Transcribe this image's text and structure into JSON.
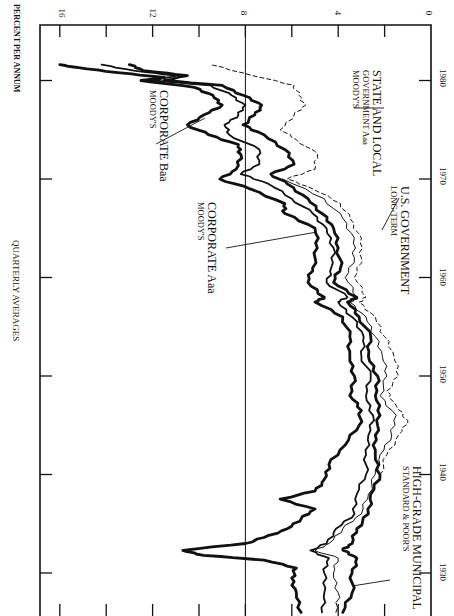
{
  "chart_data": {
    "type": "line",
    "orientation": "rotated-90",
    "title": "QUARTERLY AVERAGES",
    "xlabel": "",
    "ylabel": "PERCENT PER ANNUM",
    "xlim": [
      1926,
      1982
    ],
    "ylim": [
      0,
      17
    ],
    "x_ticks": [
      1930,
      1940,
      1950,
      1960,
      1970,
      1980
    ],
    "y_ticks": [
      0,
      2,
      4,
      6,
      8,
      10,
      12,
      14,
      16
    ],
    "y_tick_labels": [
      "0",
      "4",
      "8",
      "12",
      "16"
    ],
    "reference_line": 8,
    "grid": false,
    "series": [
      {
        "name": "CORPORATE Baa",
        "source": "MOODY'S",
        "style": "thick",
        "x": [
          1926,
          1928,
          1929.5,
          1930.5,
          1931.3,
          1931.8,
          1932.3,
          1933,
          1933.6,
          1934.5,
          1935.5,
          1936.5,
          1937.5,
          1938.3,
          1939.5,
          1941,
          1943,
          1945,
          1946.5,
          1948,
          1950,
          1952,
          1954,
          1956,
          1957.5,
          1958,
          1959.5,
          1961,
          1963,
          1965,
          1966.5,
          1967.5,
          1969,
          1970,
          1971,
          1972.5,
          1973.5,
          1974.5,
          1975.5,
          1976.5,
          1977.5,
          1978.5,
          1979.3,
          1980,
          1980.3,
          1980.8,
          1981.3,
          1981.6
        ],
        "values": [
          5.6,
          5.8,
          6.0,
          5.8,
          7.2,
          9.8,
          10.7,
          8.0,
          7.2,
          6.2,
          5.6,
          5.0,
          6.5,
          5.0,
          4.6,
          4.4,
          3.7,
          3.1,
          3.0,
          3.5,
          3.3,
          3.5,
          3.5,
          3.8,
          5.0,
          4.6,
          5.3,
          5.1,
          4.9,
          5.0,
          6.3,
          6.3,
          7.8,
          9.1,
          8.4,
          8.2,
          8.3,
          9.6,
          10.5,
          9.8,
          9.0,
          9.4,
          10.2,
          12.5,
          11.5,
          13.5,
          15.2,
          16.0
        ]
      },
      {
        "name": "CORPORATE Aaa",
        "source": "MOODY'S",
        "style": "medium",
        "x": [
          1926,
          1928,
          1930,
          1931.5,
          1932.3,
          1933,
          1934.5,
          1936,
          1938,
          1940,
          1942,
          1944,
          1946,
          1948,
          1950,
          1952,
          1954,
          1956,
          1957.5,
          1958,
          1959.5,
          1961,
          1963,
          1965,
          1966.5,
          1968,
          1969.5,
          1970.5,
          1971.5,
          1973,
          1974.5,
          1975.5,
          1976.5,
          1977.5,
          1978.5,
          1979.5,
          1980,
          1980.5,
          1981,
          1981.6
        ],
        "values": [
          4.7,
          4.6,
          4.6,
          4.4,
          5.2,
          4.5,
          4.1,
          3.3,
          3.2,
          2.8,
          2.8,
          2.7,
          2.5,
          2.8,
          2.6,
          3.0,
          2.9,
          3.4,
          4.0,
          3.6,
          4.5,
          4.3,
          4.2,
          4.5,
          5.1,
          6.0,
          7.0,
          8.2,
          7.4,
          7.4,
          8.7,
          8.9,
          8.3,
          8.0,
          8.6,
          9.5,
          12.0,
          11.0,
          12.8,
          14.2
        ]
      },
      {
        "name": "U.S. GOVERNMENT",
        "source": "LONG-TERM",
        "style": "thick",
        "x": [
          1926,
          1928,
          1930,
          1931.5,
          1932.3,
          1933,
          1934.5,
          1936,
          1938,
          1940,
          1942,
          1944,
          1946,
          1948,
          1950,
          1952,
          1954,
          1956,
          1957.5,
          1958,
          1959.5,
          1961,
          1963,
          1965,
          1966.5,
          1968,
          1969.5,
          1970.5,
          1971.5,
          1973,
          1974.5,
          1975.5,
          1976.5,
          1977.5,
          1978.5,
          1979.5,
          1980,
          1980.5,
          1981,
          1981.6
        ],
        "values": [
          3.8,
          3.4,
          3.4,
          3.2,
          3.8,
          3.4,
          3.2,
          2.7,
          2.6,
          2.2,
          2.4,
          2.4,
          2.2,
          2.4,
          2.3,
          2.7,
          2.6,
          3.1,
          3.6,
          3.2,
          4.2,
          3.9,
          4.0,
          4.2,
          4.7,
          5.3,
          6.2,
          6.9,
          5.9,
          6.3,
          7.2,
          8.1,
          7.6,
          7.3,
          8.1,
          9.0,
          11.5,
          10.5,
          12.4,
          13.0
        ]
      },
      {
        "name": "HIGH-GRADE MUNICIPAL",
        "source": "STANDARD & POOR'S",
        "style": "thin",
        "x": [
          1926,
          1928,
          1930,
          1931.5,
          1932.3,
          1933,
          1934.5,
          1936,
          1938,
          1940,
          1942,
          1944,
          1946,
          1948,
          1950,
          1952,
          1954,
          1956,
          1957.5,
          1958,
          1960,
          1962,
          1964,
          1966,
          1968,
          1970
        ],
        "values": [
          4.1,
          4.0,
          4.2,
          4.0,
          5.0,
          4.4,
          3.8,
          3.0,
          2.7,
          2.4,
          2.2,
          1.7,
          1.5,
          2.2,
          1.9,
          2.1,
          2.4,
          2.8,
          3.5,
          3.2,
          3.7,
          3.3,
          3.3,
          3.8,
          4.6,
          6.4
        ]
      },
      {
        "name": "STATE AND LOCAL GOVERNMENT Aaa",
        "source": "MOODY'S",
        "style": "dashed",
        "x": [
          1940,
          1942,
          1944,
          1945.5,
          1947,
          1948.5,
          1950,
          1952,
          1954,
          1956,
          1957.5,
          1958,
          1960,
          1962,
          1964,
          1966,
          1967.5,
          1969,
          1970,
          1971,
          1972.5,
          1974,
          1975,
          1976.5,
          1977.5,
          1978.5,
          1979.5,
          1980.5,
          1981.6
        ],
        "values": [
          2.2,
          1.9,
          1.4,
          1.0,
          1.5,
          1.9,
          1.4,
          1.6,
          2.0,
          2.4,
          3.1,
          2.8,
          3.3,
          3.0,
          3.0,
          3.5,
          3.9,
          5.1,
          6.2,
          5.0,
          4.9,
          5.8,
          6.5,
          5.9,
          5.4,
          5.7,
          5.9,
          7.7,
          9.5
        ]
      }
    ]
  },
  "labels": {
    "title": "QUARTERLY AVERAGES",
    "y_axis_title": "PERCENT PER ANNUM",
    "y_ticks": [
      "16",
      "12",
      "8",
      "4",
      "0"
    ],
    "x_ticks": [
      "1980",
      "1970",
      "1960",
      "1950",
      "1940",
      "1930"
    ],
    "baa_main": "CORPORATE Baa",
    "baa_sub": "MOODY'S",
    "aaa_main": "CORPORATE Aaa",
    "aaa_sub": "MOODY'S",
    "usgov_main": "U.S. GOVERNMENT",
    "usgov_sub": "LONG-TERM",
    "state_main": "STATE AND LOCAL",
    "state_sub1": "GOVERNMENT Aaa",
    "state_sub2": "MOODY'S",
    "muni_main": "HIGH-GRADE MUNICIPAL",
    "muni_sub": "STANDARD & POOR'S"
  },
  "colors": {
    "ink": "#111111",
    "background": "#ffffff"
  }
}
